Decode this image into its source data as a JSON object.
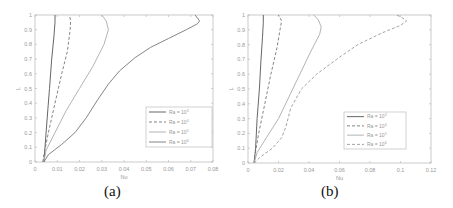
{
  "chart_data": [
    {
      "id": "a",
      "type": "line",
      "caption": "(a)",
      "xlabel": "Nu",
      "ylabel": "L",
      "xlim": [
        0,
        0.08
      ],
      "ylim": [
        0,
        1
      ],
      "xticks": [
        0,
        0.01,
        0.02,
        0.03,
        0.04,
        0.05,
        0.06,
        0.07,
        0.08
      ],
      "xtick_labels": [
        "0",
        "0.01",
        "0.02",
        "0.03",
        "0.04",
        "0.05",
        "0.06",
        "0.07",
        "0.08"
      ],
      "yticks": [
        0,
        0.1,
        0.2,
        0.3,
        0.4,
        0.5,
        0.6,
        0.7,
        0.8,
        0.9,
        1
      ],
      "ytick_labels": [
        "0",
        "0.1",
        "0.2",
        "0.3",
        "0.4",
        "0.5",
        "0.6",
        "0.7",
        "0.8",
        "0.9",
        "1"
      ],
      "grid": false,
      "legend_position": "lower right",
      "series": [
        {
          "name": "Ra = 10^3",
          "label": "Ra = 10",
          "exp": "3",
          "style": "solid",
          "color": "#555555",
          "points": [
            [
              0.004,
              0
            ],
            [
              0.0045,
              0.1
            ],
            [
              0.0055,
              0.3
            ],
            [
              0.0065,
              0.5
            ],
            [
              0.0075,
              0.7
            ],
            [
              0.0085,
              0.85
            ],
            [
              0.009,
              0.95
            ],
            [
              0.009,
              1
            ]
          ]
        },
        {
          "name": "Ra = 10^4",
          "label": "Ra = 10",
          "exp": "4",
          "style": "dashed",
          "color": "#777777",
          "points": [
            [
              0.0035,
              0
            ],
            [
              0.004,
              0.05
            ],
            [
              0.006,
              0.2
            ],
            [
              0.009,
              0.4
            ],
            [
              0.012,
              0.6
            ],
            [
              0.0145,
              0.75
            ],
            [
              0.0158,
              0.9
            ],
            [
              0.016,
              0.96
            ],
            [
              0.0155,
              1
            ]
          ]
        },
        {
          "name": "Ra = 10^5",
          "label": "Ra = 10",
          "exp": "5",
          "style": "solid",
          "color": "#aaaaaa",
          "points": [
            [
              0.004,
              0
            ],
            [
              0.005,
              0.08
            ],
            [
              0.009,
              0.2
            ],
            [
              0.014,
              0.35
            ],
            [
              0.02,
              0.5
            ],
            [
              0.026,
              0.65
            ],
            [
              0.031,
              0.8
            ],
            [
              0.033,
              0.9
            ],
            [
              0.032,
              0.96
            ],
            [
              0.03,
              1
            ]
          ]
        },
        {
          "name": "Ra = 10^6",
          "label": "Ra = 10",
          "exp": "6",
          "style": "solid",
          "color": "#777777",
          "points": [
            [
              0.004,
              0
            ],
            [
              0.006,
              0.05
            ],
            [
              0.012,
              0.12
            ],
            [
              0.018,
              0.2
            ],
            [
              0.023,
              0.3
            ],
            [
              0.028,
              0.42
            ],
            [
              0.033,
              0.53
            ],
            [
              0.038,
              0.62
            ],
            [
              0.045,
              0.71
            ],
            [
              0.052,
              0.78
            ],
            [
              0.06,
              0.84
            ],
            [
              0.068,
              0.9
            ],
            [
              0.073,
              0.94
            ],
            [
              0.074,
              0.96
            ],
            [
              0.072,
              1
            ]
          ]
        }
      ]
    },
    {
      "id": "b",
      "type": "line",
      "caption": "(b)",
      "xlabel": "Nu",
      "ylabel": "L",
      "xlim": [
        0,
        0.12
      ],
      "ylim": [
        0,
        1
      ],
      "xticks": [
        0,
        0.02,
        0.04,
        0.06,
        0.08,
        0.1,
        0.12
      ],
      "xtick_labels": [
        "0",
        "0.02",
        "0.04",
        "0.06",
        "0.08",
        "0.1",
        "0.12"
      ],
      "yticks": [
        0,
        0.1,
        0.2,
        0.3,
        0.4,
        0.5,
        0.6,
        0.7,
        0.8,
        0.9,
        1
      ],
      "ytick_labels": [
        "0",
        "0.1",
        "0.2",
        "0.3",
        "0.4",
        "0.5",
        "0.6",
        "0.7",
        "0.8",
        "0.9",
        "1"
      ],
      "grid": false,
      "legend_position": "lower right",
      "series": [
        {
          "name": "Ra = 10^3",
          "label": "Ra = 10",
          "exp": "3",
          "style": "solid",
          "color": "#555555",
          "points": [
            [
              0.004,
              0
            ],
            [
              0.005,
              0.1
            ],
            [
              0.006,
              0.3
            ],
            [
              0.0075,
              0.5
            ],
            [
              0.0085,
              0.7
            ],
            [
              0.0095,
              0.85
            ],
            [
              0.01,
              0.95
            ],
            [
              0.01,
              1
            ]
          ]
        },
        {
          "name": "Ra = 10^4",
          "label": "Ra = 10",
          "exp": "4",
          "style": "dashed",
          "color": "#777777",
          "points": [
            [
              0.004,
              0
            ],
            [
              0.0045,
              0.05
            ],
            [
              0.007,
              0.2
            ],
            [
              0.011,
              0.4
            ],
            [
              0.015,
              0.6
            ],
            [
              0.019,
              0.78
            ],
            [
              0.021,
              0.9
            ],
            [
              0.022,
              0.96
            ],
            [
              0.02,
              1
            ]
          ]
        },
        {
          "name": "Ra = 10^5",
          "label": "Ra = 10",
          "exp": "5",
          "style": "solid",
          "color": "#aaaaaa",
          "points": [
            [
              0.004,
              0
            ],
            [
              0.006,
              0.07
            ],
            [
              0.012,
              0.17
            ],
            [
              0.02,
              0.3
            ],
            [
              0.027,
              0.45
            ],
            [
              0.034,
              0.6
            ],
            [
              0.041,
              0.75
            ],
            [
              0.047,
              0.87
            ],
            [
              0.048,
              0.92
            ],
            [
              0.046,
              0.97
            ],
            [
              0.043,
              1
            ]
          ]
        },
        {
          "name": "Ra = 10^6",
          "label": "Ra = 10",
          "exp": "6",
          "style": "dashed",
          "color": "#999999",
          "points": [
            [
              0.004,
              0
            ],
            [
              0.008,
              0.04
            ],
            [
              0.016,
              0.1
            ],
            [
              0.022,
              0.17
            ],
            [
              0.025,
              0.25
            ],
            [
              0.028,
              0.37
            ],
            [
              0.035,
              0.5
            ],
            [
              0.045,
              0.6
            ],
            [
              0.058,
              0.7
            ],
            [
              0.072,
              0.8
            ],
            [
              0.088,
              0.88
            ],
            [
              0.1,
              0.93
            ],
            [
              0.104,
              0.96
            ],
            [
              0.1,
              0.99
            ],
            [
              0.097,
              1
            ]
          ]
        }
      ]
    }
  ]
}
